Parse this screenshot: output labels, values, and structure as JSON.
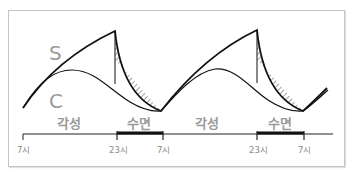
{
  "diagram": {
    "type": "two-process sleep model",
    "curves": [
      {
        "id": "S",
        "label": "S",
        "description": "Homeostatic sleep pressure: rises during wake, drops during sleep"
      },
      {
        "id": "C",
        "label": "C",
        "description": "Circadian rhythm: smooth oscillation"
      }
    ],
    "shaded_region": "Area between S and C during sleep (hatched)",
    "phases": [
      {
        "label": "각성"
      },
      {
        "label": "수면"
      },
      {
        "label": "각성"
      },
      {
        "label": "수면"
      }
    ],
    "timeline": {
      "ticks": [
        "7시",
        "23시",
        "7시",
        "23시",
        "7시"
      ],
      "sleep_bars": [
        {
          "start": "23시",
          "end": "7시"
        },
        {
          "start": "23시",
          "end": "7시"
        }
      ]
    },
    "colors": {
      "line": "#111111",
      "label_gray": "#9a9a9a",
      "frame": "#c4c4c4",
      "hatch": "#333333"
    }
  }
}
